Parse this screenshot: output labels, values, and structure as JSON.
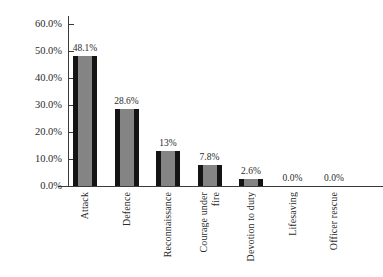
{
  "chart_data": {
    "type": "bar",
    "title": "",
    "subtitle": "",
    "xlabel": "",
    "ylabel": "",
    "categories": [
      "Attack",
      "Defence",
      "Reconnaissance",
      "Courage under fire",
      "Devotion to duty",
      "Lifesaving",
      "Officer rescue"
    ],
    "values": [
      48.1,
      28.6,
      13.0,
      7.8,
      2.6,
      0.0,
      0.0
    ],
    "value_labels": [
      "48.1%",
      "28.6%",
      "13%",
      "7.8%",
      "2.6%",
      "0.0%",
      "0.0%"
    ],
    "ylim": [
      0,
      60
    ],
    "ytick_values": [
      0,
      10,
      20,
      30,
      40,
      50,
      60
    ],
    "ytick_labels": [
      "0.0%",
      "10.0%",
      "20.0%",
      "30.0%",
      "40.0%",
      "50.0%",
      "60.0%"
    ],
    "grid": false,
    "legend": null,
    "legend_position": "none",
    "bar_fill_color": "#848484",
    "bar_edge_color": "#141414",
    "axis_color": "#3a3a3a",
    "background_color": "#ffffff",
    "category_label_rotation": 90,
    "category_label_lines": [
      [
        "Attack"
      ],
      [
        "Defence"
      ],
      [
        "Reconnaissance"
      ],
      [
        "Courage under",
        "fire"
      ],
      [
        "Devotion to duty"
      ],
      [
        "Lifesaving"
      ],
      [
        "Officer rescue"
      ]
    ]
  }
}
